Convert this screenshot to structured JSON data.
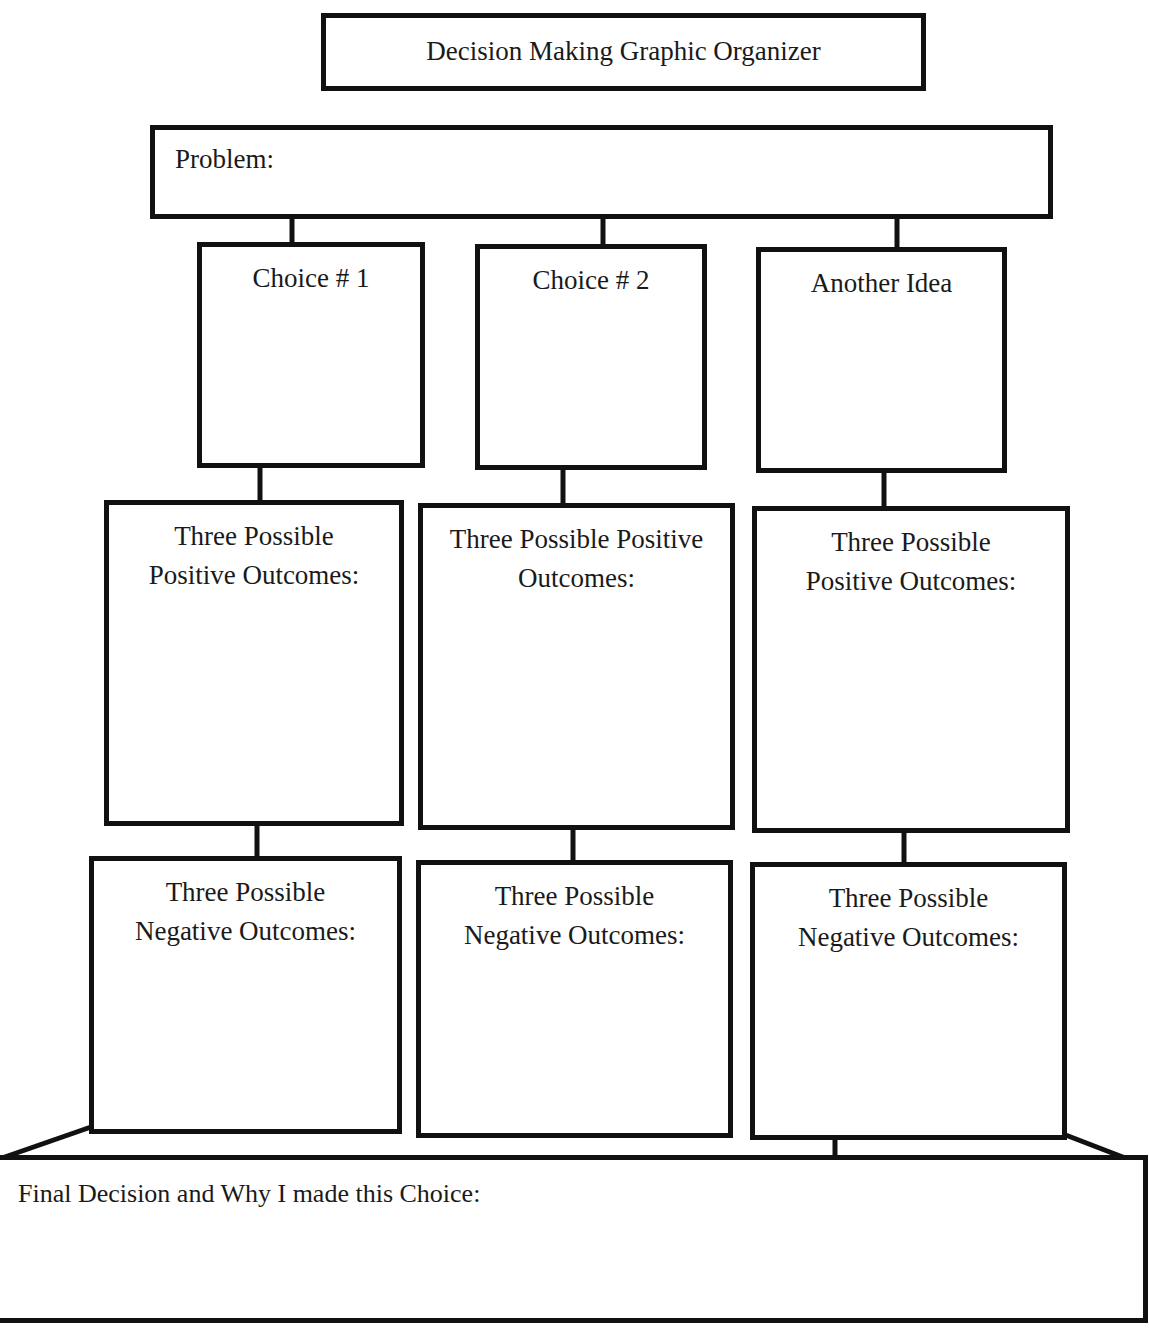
{
  "title": "Decision Making Graphic Organizer",
  "problem": {
    "label": "Problem:",
    "value": ""
  },
  "choices": [
    {
      "label": "Choice # 1",
      "positive_label": "Three Possible\nPositive Outcomes:",
      "negative_label": "Three Possible\nNegative Outcomes:"
    },
    {
      "label": "Choice # 2",
      "positive_label": "Three Possible Positive\nOutcomes:",
      "negative_label": "Three Possible\nNegative Outcomes:"
    },
    {
      "label": "Another Idea",
      "positive_label": "Three Possible\nPositive Outcomes:",
      "negative_label": "Three Possible\nNegative Outcomes:"
    }
  ],
  "final_decision": {
    "label": "Final Decision and Why I made this Choice:",
    "value": ""
  },
  "colors": {
    "line": "#111111",
    "background": "#ffffff",
    "text": "#1a1a1a"
  }
}
